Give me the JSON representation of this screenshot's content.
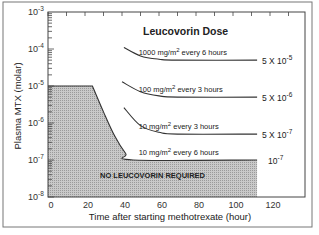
{
  "chart_data": {
    "type": "line",
    "title": "Leucovorin Dose",
    "xlabel": "Time after starting methotrexate (hour)",
    "ylabel": "Plasma MTX (molar)",
    "xlim": [
      0,
      139
    ],
    "ylim": [
      1e-08,
      0.001
    ],
    "yscale": "log",
    "grid": false,
    "x_ticks": [
      0,
      20,
      40,
      60,
      80,
      100,
      120
    ],
    "x_tick_labels": [
      "0",
      "20",
      "40",
      "60",
      "80",
      "100",
      "120"
    ],
    "y_tick_labels": [
      {
        "base": "10",
        "exp": "-3",
        "value": 0.001
      },
      {
        "base": "10",
        "exp": "-4",
        "value": 0.0001
      },
      {
        "base": "10",
        "exp": "-5",
        "value": 1e-05
      },
      {
        "base": "10",
        "exp": "-6",
        "value": 1e-06
      },
      {
        "base": "10",
        "exp": "-7",
        "value": 1e-07
      },
      {
        "base": "10",
        "exp": "-8",
        "value": 1e-08
      }
    ],
    "series": [
      {
        "name": "1000 mg/m2 every 6 hours",
        "label_prefix": "1000 mg/m",
        "label_sup": "2",
        "label_suffix": " every 6 hours",
        "threshold_label": {
          "prefix": "5 X 10",
          "exp": "-5"
        },
        "x": [
          41,
          50,
          60,
          70,
          113
        ],
        "y": [
          0.00011,
          6.5e-05,
          5.3e-05,
          5e-05,
          5e-05
        ]
      },
      {
        "name": "100 mg/m2 every 3 hours",
        "label_prefix": "100 mg/m",
        "label_sup": "2",
        "label_suffix": " every 3 hours",
        "threshold_label": {
          "prefix": "5 X 10",
          "exp": "-6"
        },
        "x": [
          40,
          50,
          60,
          70,
          113
        ],
        "y": [
          1.3e-05,
          7e-06,
          5.4e-06,
          5e-06,
          5e-06
        ]
      },
      {
        "name": "10 mg/m2 every 3 hours",
        "label_prefix": "10 mg/m",
        "label_sup": "2",
        "label_suffix": " every 3 hours",
        "threshold_label": {
          "prefix": "5 X 10",
          "exp": "-7"
        },
        "x": [
          41,
          50,
          60,
          70,
          113
        ],
        "y": [
          2.6e-06,
          8.5e-07,
          5.6e-07,
          5e-07,
          5e-07
        ]
      },
      {
        "name": "10 mg/m2 every 6 hours",
        "label_prefix": "10 mg/m",
        "label_sup": "2",
        "label_suffix": " every 6 hours",
        "threshold_label": {
          "prefix": "10",
          "exp": "-7"
        },
        "x": [
          0,
          24,
          30,
          36,
          42,
          46,
          113
        ],
        "y": [
          1e-05,
          1e-05,
          2e-06,
          4.5e-07,
          1.5e-07,
          1e-07,
          1e-07
        ]
      }
    ],
    "shaded_region": {
      "label": "NO LEUCOVORIN REQUIRED",
      "x_end": 113,
      "description": "area below 10 mg/m2 every 6 hours boundary"
    }
  },
  "colors": {
    "line": "#333333",
    "shade": "#b8b8b8",
    "frame": "#555555"
  }
}
